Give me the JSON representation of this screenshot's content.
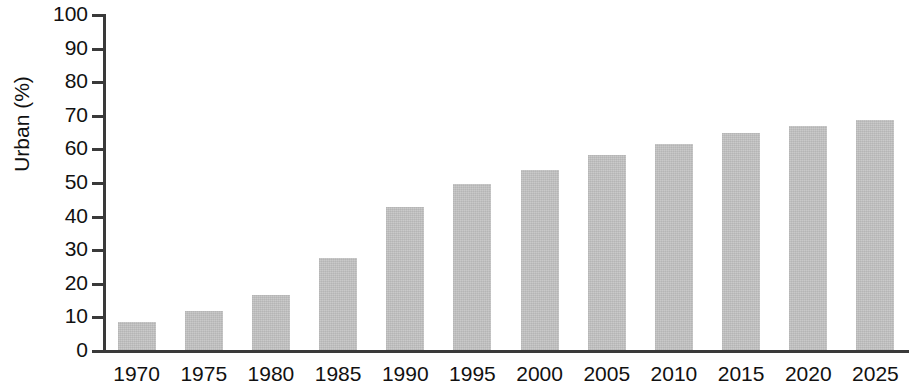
{
  "chart_data": {
    "type": "bar",
    "title": "",
    "subtitle": "",
    "xlabel": "",
    "ylabel": "Urban (%)",
    "categories": [
      "1970",
      "1975",
      "1980",
      "1985",
      "1990",
      "1995",
      "2000",
      "2005",
      "2010",
      "2015",
      "2020",
      "2025"
    ],
    "values": [
      8.3,
      11.6,
      16.4,
      27.4,
      42.5,
      49.4,
      53.6,
      58.0,
      61.3,
      64.6,
      66.7,
      68.5
    ],
    "ylim": [
      0,
      100
    ],
    "y_ticks": [
      0,
      10,
      20,
      30,
      40,
      50,
      60,
      70,
      80,
      90,
      100
    ],
    "y_tick_labels": [
      "0",
      "10",
      "20",
      "30",
      "40",
      "50",
      "60",
      "70",
      "80",
      "90",
      "100"
    ],
    "grid": false,
    "legend": null,
    "legend_position": "none",
    "bar_color": "#c4c4c4",
    "axis_color": "#3a3a3a",
    "text_color": "#111111",
    "background_color": "#ffffff",
    "annotations": []
  }
}
